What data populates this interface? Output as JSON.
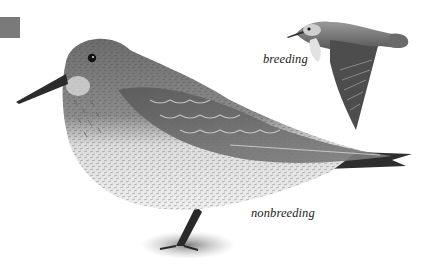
{
  "plate": {
    "subject": "Baird's Sandpiper",
    "tab_color": "#7a7a7a",
    "captions": {
      "breeding": "breeding",
      "nonbreeding": "nonbreeding"
    },
    "figures": [
      {
        "name": "standing-bird",
        "plumage": "nonbreeding"
      },
      {
        "name": "flying-bird",
        "plumage": "breeding"
      }
    ]
  }
}
